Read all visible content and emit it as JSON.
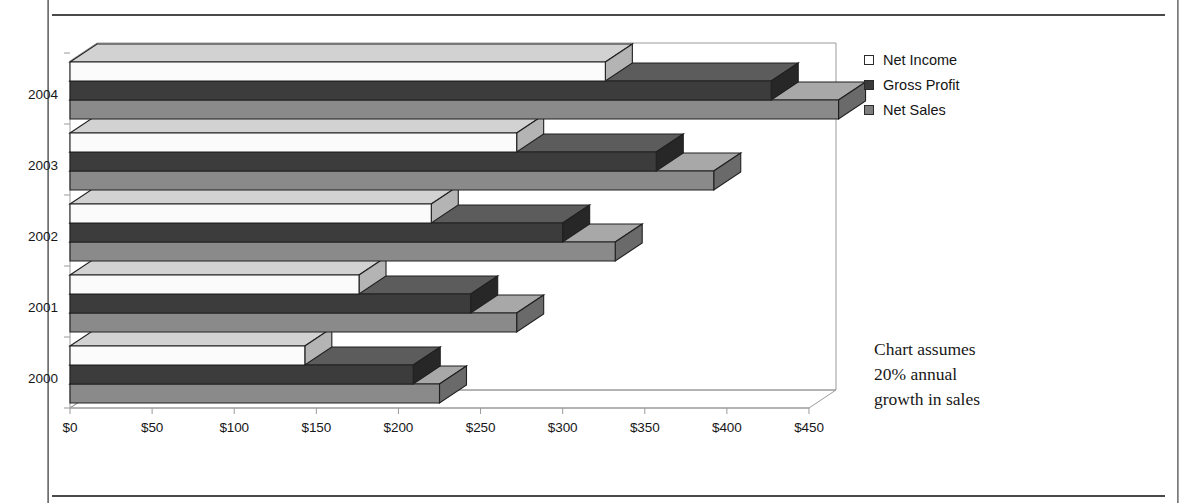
{
  "chart_data": {
    "type": "bar",
    "orientation": "horizontal",
    "style": "3d-overlapped-horizontal-bars",
    "title": "",
    "subtitle": "",
    "xlabel": "",
    "ylabel": "",
    "categories": [
      "2000",
      "2001",
      "2002",
      "2003",
      "2004"
    ],
    "series": [
      {
        "name": "Net Income",
        "values": [
          143,
          176,
          220,
          272,
          326
        ],
        "color": "#fbfbfb"
      },
      {
        "name": "Gross Profit",
        "values": [
          209,
          244,
          300,
          357,
          427
        ],
        "color": "#3c3c3c"
      },
      {
        "name": "Net Sales",
        "values": [
          225,
          272,
          332,
          392,
          468
        ],
        "color": "#8a8a8a"
      }
    ],
    "series_draw_order": [
      "Net Sales",
      "Gross Profit",
      "Net Income"
    ],
    "xlim": [
      0,
      450
    ],
    "xticks": [
      0,
      50,
      100,
      150,
      200,
      250,
      300,
      350,
      400,
      450
    ],
    "xtick_labels": [
      "$0",
      "$50",
      "$100",
      "$150",
      "$200",
      "$250",
      "$300",
      "$350",
      "$400",
      "$450"
    ],
    "ytick_labels": [
      "2004",
      "2003",
      "2002",
      "2001",
      "2000"
    ],
    "grid": false,
    "value_prefix": "$",
    "legend_position": "right-top",
    "annotation": "Chart assumes 20% annual growth in sales"
  },
  "legend": {
    "items": [
      {
        "label": "Net Income",
        "swatch": "#fdfdfd"
      },
      {
        "label": "Gross Profit",
        "swatch": "#3a3a3a"
      },
      {
        "label": "Net Sales",
        "swatch": "#7e7e7e"
      }
    ]
  },
  "annotation": {
    "line1": "Chart assumes",
    "line2": "20% annual",
    "line3": "growth in sales"
  },
  "colors": {
    "net_income_top": "#d2d2d2",
    "net_income_face": "#fbfbfb",
    "net_income_side": "#b4b4b4",
    "gross_profit_top": "#5c5c5c",
    "gross_profit_face": "#3c3c3c",
    "gross_profit_side": "#272727",
    "net_sales_top": "#a8a8a8",
    "net_sales_face": "#8a8a8a",
    "net_sales_side": "#6a6a6a",
    "outline": "#202020",
    "axis": "#9a9a9a",
    "frame_rule": "#4a4a4a",
    "text": "#171717"
  },
  "geometry": {
    "x0_px": 70,
    "px_per_unit": 1.6422,
    "depth_dx": 27,
    "depth_dy": -18,
    "plot_top_px": 43,
    "plot_bottom_px": 408,
    "group_height_px": 71,
    "bar_thickness_px": 19
  }
}
